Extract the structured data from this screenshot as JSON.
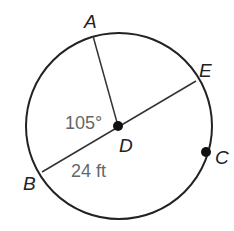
{
  "diagram": {
    "points": {
      "A": "A",
      "B": "B",
      "C": "C",
      "D": "D",
      "E": "E"
    },
    "angle_label": "105°",
    "length_label": "24 ft"
  }
}
